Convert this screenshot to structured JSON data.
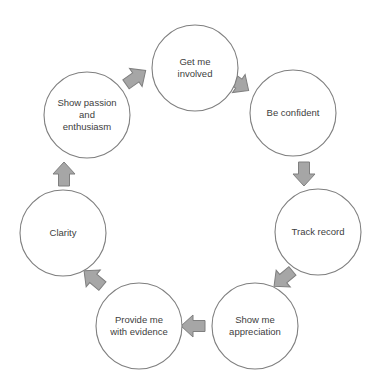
{
  "diagram": {
    "type": "cycle",
    "title": "",
    "background_color": "#ffffff",
    "circle_fill": "#ffffff",
    "circle_stroke": "#7f7f7f",
    "arrow_fill": "#a6a6a6",
    "arrow_stroke": "#7f7f7f",
    "text_color": "#404040",
    "nodes": [
      {
        "id": "get-me-involved",
        "lines": [
          "Get me",
          "involved"
        ],
        "text": "Get me involved",
        "cx": 195,
        "cy": 68,
        "r": 43
      },
      {
        "id": "be-confident",
        "lines": [
          "Be confident"
        ],
        "text": "Be confident",
        "cx": 293,
        "cy": 113,
        "r": 43
      },
      {
        "id": "track-record",
        "lines": [
          "Track record"
        ],
        "text": "Track record",
        "cx": 318,
        "cy": 232,
        "r": 43
      },
      {
        "id": "show-me-appreciation",
        "lines": [
          "Show me",
          "appreciation"
        ],
        "text": "Show me appreciation",
        "cx": 255,
        "cy": 326,
        "r": 43
      },
      {
        "id": "provide-me-with-evidence",
        "lines": [
          "Provide me",
          "with evidence"
        ],
        "text": "Provide me with evidence",
        "cx": 139,
        "cy": 326,
        "r": 43
      },
      {
        "id": "clarity",
        "lines": [
          "Clarity"
        ],
        "text": "Clarity",
        "cx": 63,
        "cy": 233,
        "r": 43
      },
      {
        "id": "show-passion-and-enthusiasm",
        "lines": [
          "Show passion",
          "and",
          "enthusiasm"
        ],
        "text": "Show passion and enthusiasm",
        "cx": 87,
        "cy": 115,
        "r": 43
      }
    ],
    "arrows": [
      {
        "id": "arrow-passion-to-involved",
        "from": "show-passion-and-enthusiasm",
        "to": "get-me-involved",
        "cx": 135,
        "cy": 78,
        "rotation": 55,
        "label": "arrow-up-right"
      },
      {
        "id": "arrow-involved-to-confident",
        "from": "get-me-involved",
        "to": "be-confident",
        "cx": 238,
        "cy": 83,
        "rotation": 125,
        "label": "arrow-down-right"
      },
      {
        "id": "arrow-confident-to-track",
        "from": "be-confident",
        "to": "track-record",
        "cx": 304,
        "cy": 173,
        "rotation": 180,
        "label": "arrow-down"
      },
      {
        "id": "arrow-track-to-appreciation",
        "from": "track-record",
        "to": "show-me-appreciation",
        "cx": 284,
        "cy": 278,
        "rotation": 230,
        "label": "arrow-down-left"
      },
      {
        "id": "arrow-appreciation-to-evidence",
        "from": "show-me-appreciation",
        "to": "provide-me-with-evidence",
        "cx": 194,
        "cy": 326,
        "rotation": 270,
        "label": "arrow-left"
      },
      {
        "id": "arrow-evidence-to-clarity",
        "from": "provide-me-with-evidence",
        "to": "clarity",
        "cx": 94,
        "cy": 279,
        "rotation": 310,
        "label": "arrow-up-left"
      },
      {
        "id": "arrow-clarity-to-passion",
        "from": "clarity",
        "to": "show-passion-and-enthusiasm",
        "cx": 64,
        "cy": 175,
        "rotation": 0,
        "label": "arrow-up"
      }
    ]
  }
}
